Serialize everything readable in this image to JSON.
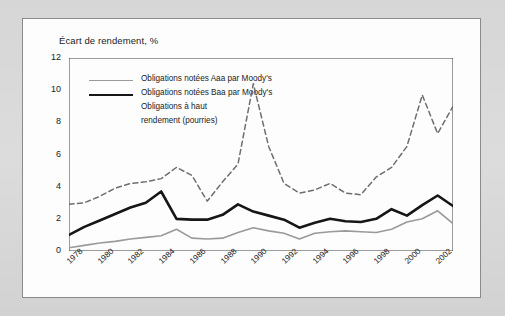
{
  "figure": {
    "background_color": "#d9d9d9",
    "panel_color": "#fdfdfd",
    "panel_border_color": "#8b8b8b"
  },
  "chart_data": {
    "type": "line",
    "title": "Écart de rendement, %",
    "xlabel": "",
    "ylabel": "",
    "ylim": [
      0,
      12
    ],
    "yticks": [
      0,
      2,
      4,
      6,
      8,
      10,
      12
    ],
    "xlim": [
      1978,
      2003
    ],
    "xticks": [
      1978,
      1980,
      1982,
      1984,
      1986,
      1988,
      1990,
      1992,
      1994,
      1996,
      1998,
      2000,
      2002
    ],
    "xtick_labels": [
      "1978",
      "1980",
      "1982",
      "1984",
      "1986",
      "1988",
      "1990",
      "1992",
      "1994",
      "1996",
      "1998",
      "2000",
      "2002"
    ],
    "grid": false,
    "legend_position": "upper-left",
    "x": [
      1978,
      1979,
      1980,
      1981,
      1982,
      1983,
      1984,
      1985,
      1986,
      1987,
      1988,
      1989,
      1990,
      1991,
      1992,
      1993,
      1994,
      1995,
      1996,
      1997,
      1998,
      1999,
      2000,
      2001,
      2002,
      2003
    ],
    "series": [
      {
        "name": "Obligations notées Aaa par Moody's",
        "color": "#9a9a9a",
        "style": "solid",
        "width": 1.6,
        "values": [
          0.2,
          0.35,
          0.5,
          0.6,
          0.75,
          0.85,
          0.95,
          1.35,
          0.8,
          0.75,
          0.8,
          1.15,
          1.45,
          1.25,
          1.1,
          0.75,
          1.1,
          1.2,
          1.25,
          1.2,
          1.15,
          1.35,
          1.8,
          2.0,
          2.5,
          1.7
        ],
        "legend_label": "Obligations notées Aaa par Moody's"
      },
      {
        "name": "Obligations notées Baa par Moody's",
        "color": "#161616",
        "style": "solid",
        "width": 2.6,
        "values": [
          1.0,
          1.5,
          1.9,
          2.3,
          2.7,
          3.0,
          3.7,
          2.0,
          1.95,
          1.95,
          2.25,
          2.9,
          2.45,
          2.2,
          1.95,
          1.45,
          1.75,
          2.0,
          1.85,
          1.8,
          2.0,
          2.6,
          2.2,
          2.85,
          3.45,
          2.8
        ],
        "legend_label": "Obligations notées Baa par Moody's"
      },
      {
        "name": "Obligations à haut rendement (pourries)",
        "color": "#6e6e6e",
        "style": "dashed",
        "width": 1.5,
        "values": [
          2.9,
          3.0,
          3.4,
          3.9,
          4.2,
          4.3,
          4.5,
          5.2,
          4.7,
          3.1,
          4.3,
          5.4,
          10.4,
          6.5,
          4.2,
          3.6,
          3.8,
          4.2,
          3.6,
          3.5,
          4.6,
          5.2,
          6.5,
          9.7,
          7.3,
          9.0
        ],
        "legend_label": "Obligations à haut rendement (pourries)",
        "legend_label_line1": "Obligations à haut",
        "legend_label_line2": "rendement (pourries)"
      }
    ],
    "tail_point": {
      "x": 2003.4,
      "values": [
        1.7,
        2.8,
        5.0
      ]
    }
  }
}
